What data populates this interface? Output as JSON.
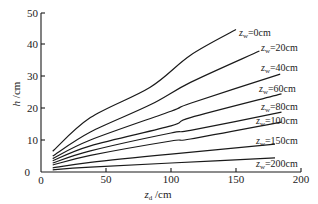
{
  "chart_data": {
    "type": "line",
    "title": "",
    "xlabel": "z_d /cm",
    "ylabel": "h /cm",
    "xlim": [
      0,
      200
    ],
    "ylim": [
      0,
      50
    ],
    "grid": false,
    "legend_position": "inline labels at line ends",
    "x_ticks": [
      0,
      50,
      100,
      150,
      200
    ],
    "y_ticks": [
      0,
      10,
      20,
      30,
      40,
      50
    ],
    "series": [
      {
        "name": "z_w=0cm",
        "x": [
          9,
          38,
          84,
          115,
          150
        ],
        "y": [
          6.5,
          17.0,
          26.5,
          36.5,
          44.5
        ]
      },
      {
        "name": "z_w=20cm",
        "x": [
          9,
          38,
          84,
          115,
          168
        ],
        "y": [
          5.0,
          12.5,
          21.0,
          28.0,
          37.8
        ]
      },
      {
        "name": "z_w=40cm",
        "x": [
          9,
          38,
          100,
          115,
          184
        ],
        "y": [
          4.2,
          10.0,
          19.0,
          21.5,
          30.6
        ]
      },
      {
        "name": "z_w=60cm",
        "x": [
          9,
          38,
          100,
          115,
          185
        ],
        "y": [
          3.5,
          8.2,
          14.4,
          17.0,
          24.4
        ]
      },
      {
        "name": "z_w=80cm",
        "x": [
          9,
          38,
          100,
          115,
          185
        ],
        "y": [
          2.8,
          6.6,
          12.2,
          13.0,
          18.7
        ]
      },
      {
        "name": "z_w=100cm",
        "x": [
          9,
          38,
          100,
          115,
          185
        ],
        "y": [
          2.2,
          5.2,
          9.7,
          10.3,
          15.6
        ]
      },
      {
        "name": "z_w=150cm",
        "x": [
          9,
          38,
          100,
          180
        ],
        "y": [
          1.3,
          3.0,
          5.6,
          8.7
        ]
      },
      {
        "name": "z_w=200cm",
        "x": [
          9,
          38,
          100,
          180
        ],
        "y": [
          0.7,
          1.5,
          2.8,
          4.4
        ]
      }
    ]
  },
  "axes": {
    "x_title_var": "z",
    "x_title_sub": "d",
    "x_title_unit": " /cm",
    "y_title_var": "h",
    "y_title_unit": " /cm",
    "x_tick_labels": [
      "0",
      "50",
      "100",
      "150",
      "200"
    ],
    "y_tick_labels": [
      "0",
      "10",
      "20",
      "30",
      "40",
      "50"
    ]
  },
  "labels": [
    {
      "var": "z",
      "sub": "w",
      "text": "=0cm"
    },
    {
      "var": "z",
      "sub": "w",
      "text": "=20cm"
    },
    {
      "var": "z",
      "sub": "w",
      "text": "=40cm"
    },
    {
      "var": "z",
      "sub": "w",
      "text": "=60cm"
    },
    {
      "var": "z",
      "sub": "w",
      "text": "=80cm"
    },
    {
      "var": "z",
      "sub": "w",
      "text": "=100cm"
    },
    {
      "var": "z",
      "sub": "w",
      "text": "=150cm"
    },
    {
      "var": "z",
      "sub": "w",
      "text": "=200cm"
    }
  ]
}
